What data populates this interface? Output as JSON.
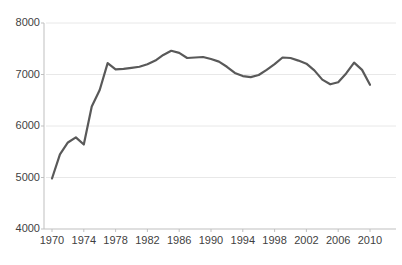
{
  "chart_data": {
    "type": "line",
    "title": "",
    "xlabel": "",
    "ylabel": "",
    "xlim": [
      1970,
      2010
    ],
    "ylim": [
      4000,
      8000
    ],
    "grid": true,
    "legend": null,
    "y_ticks": [
      "8000",
      "7000",
      "6000",
      "5000",
      "4000"
    ],
    "y_tick_values": [
      8000,
      7000,
      6000,
      5000,
      4000
    ],
    "x_ticks": [
      "1970",
      "1974",
      "1978",
      "1982",
      "1986",
      "1990",
      "1994",
      "1998",
      "2002",
      "2006",
      "2010"
    ],
    "x_tick_values": [
      1970,
      1974,
      1978,
      1982,
      1986,
      1990,
      1994,
      1998,
      2002,
      2006,
      2010
    ],
    "line_color": "#595959",
    "line_width": 2.2,
    "background_color": "#ffffff",
    "gridline_color": "#e8e8e8",
    "axis_color": "#bfbfbf",
    "series": [
      {
        "name": "series-1",
        "x": [
          1970,
          1971,
          1972,
          1973,
          1974,
          1975,
          1976,
          1977,
          1978,
          1979,
          1980,
          1981,
          1982,
          1983,
          1984,
          1985,
          1986,
          1987,
          1988,
          1989,
          1990,
          1991,
          1992,
          1993,
          1994,
          1995,
          1996,
          1997,
          1998,
          1999,
          2000,
          2001,
          2002,
          2003,
          2004,
          2005,
          2006,
          2007,
          2008,
          2009,
          2010
        ],
        "values": [
          4980,
          5450,
          5680,
          5780,
          5640,
          6380,
          6700,
          7220,
          7100,
          7110,
          7130,
          7150,
          7200,
          7270,
          7380,
          7460,
          7420,
          7320,
          7330,
          7340,
          7300,
          7250,
          7150,
          7030,
          6970,
          6950,
          6990,
          7090,
          7200,
          7330,
          7320,
          7270,
          7210,
          7080,
          6900,
          6810,
          6850,
          7020,
          7230,
          7090,
          6800
        ]
      }
    ]
  }
}
